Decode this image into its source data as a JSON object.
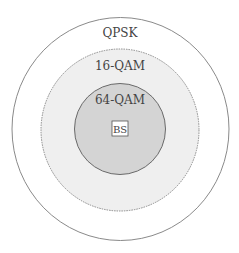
{
  "diagram": {
    "regions": [
      {
        "label": "QPSK",
        "fill": "#ffffff",
        "stroke": "#8a8a8a",
        "style": "solid"
      },
      {
        "label": "16-QAM",
        "fill": "#efefef",
        "stroke": "#8a8a8a",
        "style": "dashed"
      },
      {
        "label": "64-QAM",
        "fill": "#d4d4d4",
        "stroke": "#6a6a6a",
        "style": "solid"
      }
    ],
    "center": {
      "label": "BS"
    }
  }
}
